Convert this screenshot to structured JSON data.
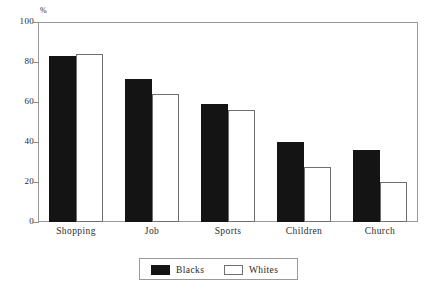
{
  "chart_data": {
    "type": "bar",
    "title": "",
    "subtitle": "",
    "xlabel": "",
    "ylabel": "%",
    "ylim": [
      0,
      100
    ],
    "yticks": [
      0,
      20,
      40,
      60,
      80,
      100
    ],
    "ytick_labels": [
      "0",
      "20",
      "40",
      "60",
      "80",
      "100"
    ],
    "grid": false,
    "legend_position": "bottom-center",
    "categories": [
      "Shopping",
      "Job",
      "Sports",
      "Children",
      "Church"
    ],
    "series": [
      {
        "name": "Blacks",
        "color": "#141414",
        "style": "filled",
        "values": [
          83,
          71.5,
          59,
          40,
          36
        ]
      },
      {
        "name": "Whites",
        "color": "#ffffff",
        "style": "outline",
        "values": [
          84,
          64,
          56,
          27.5,
          20
        ]
      }
    ]
  },
  "axis": {
    "unit_label": "%"
  }
}
